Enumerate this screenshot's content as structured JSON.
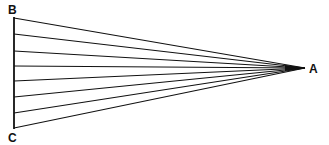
{
  "diagram": {
    "labels": {
      "A": "A",
      "B": "B",
      "C": "C"
    },
    "points": {
      "A": [
        305,
        68
      ],
      "B": [
        14,
        17
      ],
      "C": [
        14,
        129
      ]
    },
    "ray_count": 8,
    "ray_endpoints_y": [
      18,
      34,
      51,
      66,
      81,
      97,
      113,
      128
    ],
    "colors": {
      "line": "#111111",
      "background": "#ffffff"
    }
  }
}
